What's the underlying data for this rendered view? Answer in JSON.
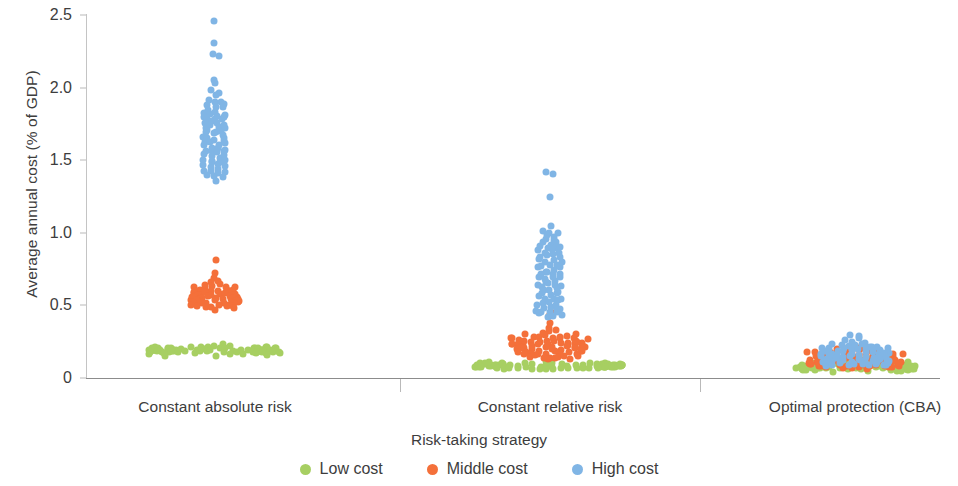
{
  "chart_data": {
    "type": "scatter",
    "title": "",
    "xlabel": "Risk-taking strategy",
    "ylabel": "Average annual cost (% of GDP)",
    "ylim": [
      0,
      2.5
    ],
    "yticks": [
      0,
      0.5,
      1.0,
      1.5,
      2.0,
      2.5
    ],
    "ytick_labels": [
      "0",
      "0.5",
      "1.0",
      "1.5",
      "2.0",
      "2.5"
    ],
    "grid": false,
    "legend_position": "bottom",
    "categories": [
      "Constant absolute risk",
      "Constant relative risk",
      "Optimal protection (CBA)"
    ],
    "series": [
      {
        "name": "Low cost",
        "color": "#a7cf62"
      },
      {
        "name": "Middle cost",
        "color": "#f4703a"
      },
      {
        "name": "High cost",
        "color": "#80b5e5"
      }
    ],
    "points": {
      "Constant absolute risk": {
        "Low cost": [
          0.21,
          0.2,
          0.19,
          0.18,
          0.2,
          0.17,
          0.19,
          0.21,
          0.18,
          0.2,
          0.16,
          0.19,
          0.22,
          0.18,
          0.17,
          0.2,
          0.19,
          0.21,
          0.18,
          0.2,
          0.17,
          0.19,
          0.2,
          0.18,
          0.21,
          0.19,
          0.17,
          0.2,
          0.18,
          0.22,
          0.19,
          0.2,
          0.17,
          0.18,
          0.21,
          0.19,
          0.2,
          0.18,
          0.16,
          0.19,
          0.21,
          0.2,
          0.18,
          0.17,
          0.19,
          0.2,
          0.22,
          0.18,
          0.19,
          0.21,
          0.17,
          0.2,
          0.18,
          0.19,
          0.2,
          0.21,
          0.18,
          0.17,
          0.19,
          0.2,
          0.24,
          0.23,
          0.18,
          0.19,
          0.2,
          0.17,
          0.21,
          0.18,
          0.19,
          0.2,
          0.16,
          0.18,
          0.2,
          0.19,
          0.21,
          0.17,
          0.19,
          0.2,
          0.18,
          0.19
        ],
        "Middle cost": [
          0.81,
          0.72,
          0.69,
          0.66,
          0.64,
          0.62,
          0.61,
          0.6,
          0.59,
          0.58,
          0.57,
          0.57,
          0.56,
          0.56,
          0.55,
          0.55,
          0.54,
          0.54,
          0.53,
          0.53,
          0.62,
          0.6,
          0.58,
          0.57,
          0.56,
          0.55,
          0.54,
          0.53,
          0.52,
          0.52,
          0.51,
          0.51,
          0.5,
          0.5,
          0.49,
          0.49,
          0.61,
          0.59,
          0.57,
          0.56,
          0.55,
          0.54,
          0.53,
          0.52,
          0.51,
          0.5,
          0.63,
          0.6,
          0.58,
          0.56,
          0.55,
          0.54,
          0.53,
          0.52,
          0.6,
          0.58,
          0.57,
          0.55,
          0.54,
          0.53,
          0.65,
          0.62,
          0.59,
          0.57,
          0.55,
          0.54,
          0.67,
          0.63,
          0.6,
          0.58,
          0.56,
          0.54,
          0.52,
          0.51,
          0.5,
          0.49,
          0.48,
          0.47,
          0.59,
          0.57
        ],
        "High cost": [
          2.45,
          2.3,
          2.24,
          2.22,
          2.05,
          2.03,
          1.98,
          1.96,
          1.94,
          1.92,
          1.9,
          1.88,
          1.87,
          1.85,
          1.84,
          1.83,
          1.82,
          1.81,
          1.8,
          1.79,
          1.78,
          1.77,
          1.76,
          1.75,
          1.74,
          1.73,
          1.72,
          1.71,
          1.7,
          1.69,
          1.68,
          1.67,
          1.66,
          1.65,
          1.64,
          1.63,
          1.62,
          1.61,
          1.6,
          1.59,
          1.58,
          1.57,
          1.56,
          1.55,
          1.54,
          1.53,
          1.52,
          1.51,
          1.5,
          1.49,
          1.48,
          1.47,
          1.46,
          1.45,
          1.44,
          1.43,
          1.42,
          1.41,
          1.4,
          1.39,
          1.9,
          1.86,
          1.82,
          1.78,
          1.74,
          1.7,
          1.66,
          1.62,
          1.58,
          1.54,
          1.88,
          1.8,
          1.72,
          1.64,
          1.56,
          1.5,
          1.46,
          1.42,
          1.38,
          1.36
        ]
      },
      "Constant relative risk": {
        "Low cost": [
          0.09,
          0.08,
          0.08,
          0.09,
          0.07,
          0.08,
          0.09,
          0.1,
          0.08,
          0.07,
          0.09,
          0.08,
          0.1,
          0.09,
          0.07,
          0.08,
          0.09,
          0.08,
          0.07,
          0.09,
          0.1,
          0.08,
          0.09,
          0.07,
          0.08,
          0.09,
          0.08,
          0.1,
          0.07,
          0.09,
          0.08,
          0.09,
          0.07,
          0.08,
          0.1,
          0.09,
          0.08,
          0.07,
          0.09,
          0.08,
          0.12,
          0.11,
          0.09,
          0.08,
          0.07,
          0.09,
          0.08,
          0.1,
          0.09,
          0.07,
          0.08,
          0.09,
          0.08,
          0.07,
          0.09,
          0.1,
          0.08,
          0.09,
          0.07,
          0.08,
          0.09,
          0.08,
          0.07,
          0.09,
          0.1,
          0.08,
          0.09,
          0.08,
          0.07,
          0.09,
          0.08,
          0.09,
          0.07,
          0.08,
          0.09,
          0.1,
          0.08,
          0.07,
          0.09,
          0.08
        ],
        "Middle cost": [
          0.45,
          0.42,
          0.38,
          0.34,
          0.31,
          0.3,
          0.29,
          0.28,
          0.27,
          0.27,
          0.26,
          0.26,
          0.25,
          0.25,
          0.24,
          0.24,
          0.23,
          0.23,
          0.22,
          0.22,
          0.21,
          0.21,
          0.2,
          0.2,
          0.19,
          0.19,
          0.18,
          0.18,
          0.17,
          0.17,
          0.16,
          0.16,
          0.15,
          0.15,
          0.14,
          0.14,
          0.3,
          0.28,
          0.26,
          0.25,
          0.24,
          0.23,
          0.22,
          0.21,
          0.2,
          0.19,
          0.29,
          0.27,
          0.25,
          0.24,
          0.23,
          0.22,
          0.21,
          0.2,
          0.18,
          0.17,
          0.32,
          0.29,
          0.27,
          0.25,
          0.23,
          0.21,
          0.19,
          0.17,
          0.16,
          0.15,
          0.33,
          0.3,
          0.27,
          0.24,
          0.22,
          0.2,
          0.18,
          0.16,
          0.15,
          0.14,
          0.13,
          0.13,
          0.26,
          0.24
        ],
        "High cost": [
          1.42,
          1.41,
          1.24,
          1.04,
          1.02,
          1.0,
          0.98,
          0.96,
          0.94,
          0.92,
          0.9,
          0.88,
          0.86,
          0.84,
          0.82,
          0.8,
          0.78,
          0.76,
          0.74,
          0.72,
          0.7,
          0.68,
          0.66,
          0.64,
          0.62,
          0.6,
          0.58,
          0.56,
          0.54,
          0.52,
          0.5,
          0.48,
          0.46,
          0.44,
          0.42,
          0.97,
          0.93,
          0.89,
          0.85,
          0.81,
          0.77,
          0.73,
          0.69,
          0.65,
          0.61,
          0.57,
          0.53,
          0.49,
          0.45,
          0.43,
          1.0,
          0.95,
          0.9,
          0.85,
          0.8,
          0.75,
          0.7,
          0.65,
          0.6,
          0.55,
          0.5,
          0.46,
          0.44,
          0.88,
          0.83,
          0.78,
          0.72,
          0.67,
          0.62,
          0.58,
          0.53,
          0.48,
          0.45,
          0.91,
          0.86,
          0.76,
          0.71,
          0.63,
          0.55,
          0.47
        ]
      },
      "Optimal protection (CBA)": {
        "Low cost": [
          0.11,
          0.1,
          0.09,
          0.08,
          0.07,
          0.12,
          0.1,
          0.09,
          0.08,
          0.07,
          0.13,
          0.11,
          0.1,
          0.09,
          0.08,
          0.07,
          0.06,
          0.12,
          0.1,
          0.09,
          0.08,
          0.07,
          0.14,
          0.12,
          0.1,
          0.09,
          0.08,
          0.07,
          0.06,
          0.11,
          0.1,
          0.09,
          0.08,
          0.07,
          0.06,
          0.13,
          0.11,
          0.09,
          0.08,
          0.07,
          0.15,
          0.12,
          0.1,
          0.09,
          0.08,
          0.07,
          0.06,
          0.05,
          0.11,
          0.09,
          0.08,
          0.07,
          0.06,
          0.1,
          0.09,
          0.08,
          0.07,
          0.06,
          0.05,
          0.09,
          0.08,
          0.07,
          0.06,
          0.05,
          0.1,
          0.09,
          0.08,
          0.07,
          0.06,
          0.08,
          0.07,
          0.06,
          0.05,
          0.09,
          0.08,
          0.07,
          0.06,
          0.05,
          0.07,
          0.06
        ],
        "Middle cost": [
          0.22,
          0.2,
          0.19,
          0.18,
          0.17,
          0.16,
          0.15,
          0.15,
          0.14,
          0.14,
          0.13,
          0.13,
          0.12,
          0.12,
          0.11,
          0.11,
          0.1,
          0.1,
          0.09,
          0.09,
          0.21,
          0.19,
          0.18,
          0.17,
          0.16,
          0.15,
          0.14,
          0.13,
          0.12,
          0.11,
          0.1,
          0.09,
          0.08,
          0.2,
          0.18,
          0.16,
          0.15,
          0.14,
          0.13,
          0.12,
          0.11,
          0.1,
          0.09,
          0.08,
          0.07,
          0.19,
          0.17,
          0.16,
          0.14,
          0.13,
          0.12,
          0.11,
          0.1,
          0.09,
          0.08,
          0.18,
          0.16,
          0.14,
          0.13,
          0.12,
          0.11,
          0.1,
          0.09,
          0.08,
          0.07,
          0.17,
          0.15,
          0.13,
          0.12,
          0.11,
          0.1,
          0.09,
          0.08,
          0.07,
          0.06,
          0.16,
          0.14,
          0.12,
          0.1,
          0.08
        ],
        "High cost": [
          0.3,
          0.29,
          0.26,
          0.25,
          0.24,
          0.23,
          0.22,
          0.21,
          0.2,
          0.19,
          0.18,
          0.18,
          0.17,
          0.17,
          0.16,
          0.16,
          0.15,
          0.15,
          0.14,
          0.14,
          0.13,
          0.13,
          0.12,
          0.12,
          0.11,
          0.11,
          0.1,
          0.1,
          0.09,
          0.09,
          0.27,
          0.25,
          0.23,
          0.21,
          0.19,
          0.18,
          0.17,
          0.16,
          0.15,
          0.14,
          0.13,
          0.12,
          0.11,
          0.1,
          0.09,
          0.24,
          0.22,
          0.2,
          0.18,
          0.17,
          0.16,
          0.15,
          0.13,
          0.12,
          0.11,
          0.1,
          0.22,
          0.2,
          0.18,
          0.16,
          0.14,
          0.13,
          0.12,
          0.11,
          0.1,
          0.09,
          0.21,
          0.19,
          0.17,
          0.15,
          0.13,
          0.11,
          0.1,
          0.09,
          0.08,
          0.2,
          0.17,
          0.14,
          0.12,
          0.1
        ]
      }
    }
  },
  "axes": {
    "y_title": "Average annual cost (% of GDP)",
    "x_title": "Risk-taking strategy",
    "y_labels": [
      "2.5",
      "2.0",
      "1.5",
      "1.0",
      "0.5",
      "0"
    ],
    "x_labels": [
      "Constant absolute risk",
      "Constant relative risk",
      "Optimal protection (CBA)"
    ]
  },
  "legend": {
    "items": [
      {
        "label": "Low cost",
        "color": "#a7cf62"
      },
      {
        "label": "Middle cost",
        "color": "#f4703a"
      },
      {
        "label": "High cost",
        "color": "#80b5e5"
      }
    ]
  }
}
